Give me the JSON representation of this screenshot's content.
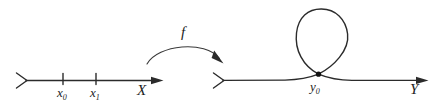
{
  "figure": {
    "kind": "math-diagram",
    "background_color": "#ffffff",
    "ink_color": "#2b2b2b",
    "width": 443,
    "height": 103
  },
  "domain_axis": {
    "name": "X",
    "label": "X",
    "left_cap_icon": "open-chevron-right-icon",
    "right_cap_icon": "arrowhead-right-icon",
    "ticks": [
      {
        "id": "x0",
        "label": "x",
        "subscript": "0"
      },
      {
        "id": "x1",
        "label": "x",
        "subscript": "1"
      }
    ]
  },
  "map_arrow": {
    "label": "f",
    "icon": "curved-arrow-right-icon",
    "direction": "left-to-right"
  },
  "codomain_axis": {
    "name": "Y",
    "label": "Y",
    "left_cap_icon": "open-chevron-right-icon",
    "right_cap_icon": "arrowhead-right-icon",
    "node": {
      "id": "y0",
      "label": "y",
      "subscript": "0",
      "icon": "node-dot-icon",
      "feature": "loop-self-intersection"
    }
  }
}
